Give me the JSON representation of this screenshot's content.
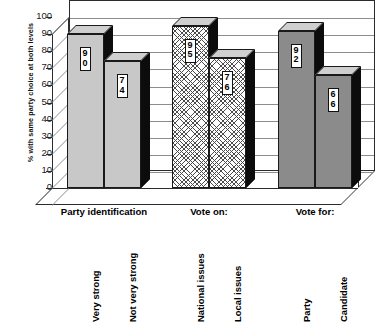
{
  "chart_data": {
    "type": "bar",
    "title": "",
    "xlabel": "",
    "ylabel": "% with same party choice at both levels",
    "ylim": [
      0,
      100
    ],
    "ytick_step": 10,
    "yticks": [
      "100",
      "90",
      "80",
      "70",
      "60",
      "50",
      "40",
      "30",
      "20",
      "10",
      "0"
    ],
    "grid": true,
    "legend": "none",
    "three_d": true,
    "groups": [
      {
        "header": "Party identification",
        "fill": "light-gray",
        "bars": [
          {
            "category": "Very strong",
            "value": 90,
            "label": "90"
          },
          {
            "category": "Not very strong",
            "value": 74,
            "label": "74"
          }
        ]
      },
      {
        "header": "Vote on:",
        "fill": "cross-hatch",
        "bars": [
          {
            "category": "National issues",
            "value": 95,
            "label": "95"
          },
          {
            "category": "Local issues",
            "value": 76,
            "label": "76"
          }
        ]
      },
      {
        "header": "Vote for:",
        "fill": "medium-gray",
        "bars": [
          {
            "category": "Party",
            "value": 92,
            "label": "92"
          },
          {
            "category": "Candidate",
            "value": 66,
            "label": "66"
          }
        ]
      }
    ],
    "categories": [
      "Very strong",
      "Not very strong",
      "National issues",
      "Local issues",
      "Party",
      "Candidate"
    ],
    "values": [
      90,
      74,
      95,
      76,
      92,
      66
    ],
    "colors": {
      "light_gray": "#c8c8c8",
      "medium_gray": "#8b8b8b",
      "hatch_line": "#4a4a4a",
      "bar_side_3d": "#0c0c0c",
      "axis": "#2b2b2b",
      "gridline": "#8d8d8d",
      "background": "#ffffff"
    }
  }
}
